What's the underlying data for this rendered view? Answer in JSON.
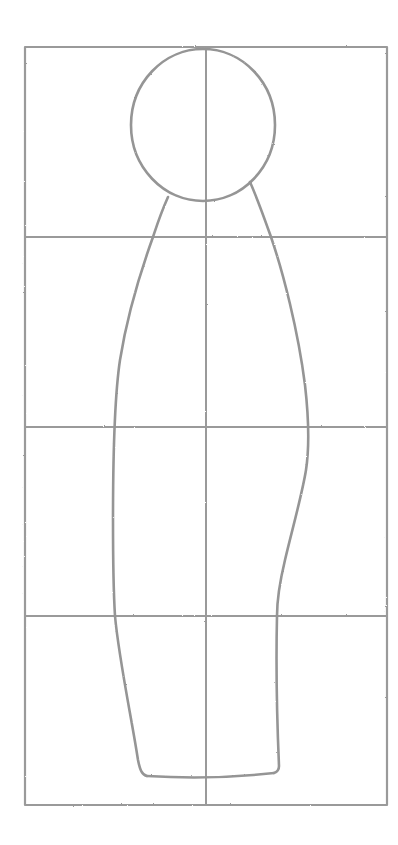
{
  "artwork": {
    "type": "pencil figure proportion sketch",
    "background_color": "#ffffff",
    "pencil_color": "#9a9a9a",
    "pencil_dark_color": "#8c8c8c"
  },
  "grid": {
    "frame": {
      "x1": 25,
      "y1": 47,
      "x2": 387,
      "y2": 805
    },
    "vertical_center_x": 206,
    "horizontal_lines_y": [
      237,
      427,
      616
    ],
    "columns": 2,
    "rows": 4
  },
  "figure": {
    "head": {
      "cx": 203,
      "cy": 125,
      "rx": 72,
      "ry": 76
    },
    "left_contour": [
      [
        168,
        197
      ],
      [
        153,
        237
      ],
      [
        135,
        300
      ],
      [
        122,
        350
      ],
      [
        114,
        427
      ],
      [
        113,
        520
      ],
      [
        115,
        616
      ],
      [
        128,
        700
      ],
      [
        142,
        773
      ]
    ],
    "right_contour": [
      [
        250,
        182
      ],
      [
        271,
        237
      ],
      [
        290,
        310
      ],
      [
        303,
        380
      ],
      [
        308,
        427
      ],
      [
        306,
        470
      ],
      [
        296,
        510
      ],
      [
        284,
        560
      ],
      [
        277,
        616
      ],
      [
        277,
        700
      ],
      [
        280,
        772
      ]
    ],
    "base": {
      "x1": 142,
      "y1": 776,
      "x2": 280,
      "y2": 774
    }
  }
}
